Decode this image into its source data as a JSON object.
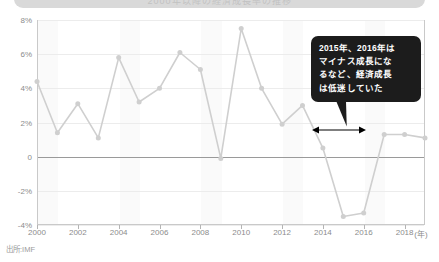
{
  "header": {
    "bar_text": "2000年以降の経済成長率の推移",
    "bar_color": "#d9d9d9"
  },
  "source_note": "出所:IMF",
  "callout": {
    "text": "2015年、2016年は\nマイナス成長にな\nるなど、経済成長\nは低迷していた",
    "background": "#1c1c1c",
    "text_color": "#ffffff"
  },
  "annotation": {
    "span_arrow_label": "",
    "span_from": 2015,
    "span_to": 2016,
    "color": "#000000"
  },
  "axis": {
    "y_ticks": [
      "8%",
      "6%",
      "4%",
      "2%",
      "0",
      "-2%",
      "-4%"
    ],
    "x_ticks": [
      "2000",
      "2002",
      "2004",
      "2006",
      "2008",
      "2010",
      "2012",
      "2014",
      "2016",
      "2018"
    ],
    "x_unit": "(年)",
    "tick_color": "#8c8c8c"
  },
  "chart_data": {
    "type": "line",
    "title": "",
    "subtitle": "",
    "xlabel": "(年)",
    "ylabel": "",
    "ylim": [
      -4,
      8
    ],
    "xlim": [
      2000,
      2019
    ],
    "grid": true,
    "legend": "none",
    "line_color": "#cfcfcf",
    "marker_color": "#cfcfcf",
    "x": [
      2000,
      2001,
      2002,
      2003,
      2004,
      2005,
      2006,
      2007,
      2008,
      2009,
      2010,
      2011,
      2012,
      2013,
      2014,
      2015,
      2016,
      2017,
      2018,
      2019
    ],
    "values": [
      4.4,
      1.4,
      3.1,
      1.1,
      5.8,
      3.2,
      4.0,
      6.1,
      5.1,
      -0.1,
      7.5,
      4.0,
      1.9,
      3.0,
      0.5,
      -3.5,
      -3.3,
      1.3,
      1.3,
      1.1
    ],
    "categories": [
      "2000",
      "2001",
      "2002",
      "2003",
      "2004",
      "2005",
      "2006",
      "2007",
      "2008",
      "2009",
      "2010",
      "2011",
      "2012",
      "2013",
      "2014",
      "2015",
      "2016",
      "2017",
      "2018",
      "2019"
    ],
    "annotations": [
      {
        "text": "2015年、2016年はマイナス成長になるなど、経済成長は低迷していた",
        "target_x_range": [
          2015,
          2016
        ]
      }
    ]
  }
}
